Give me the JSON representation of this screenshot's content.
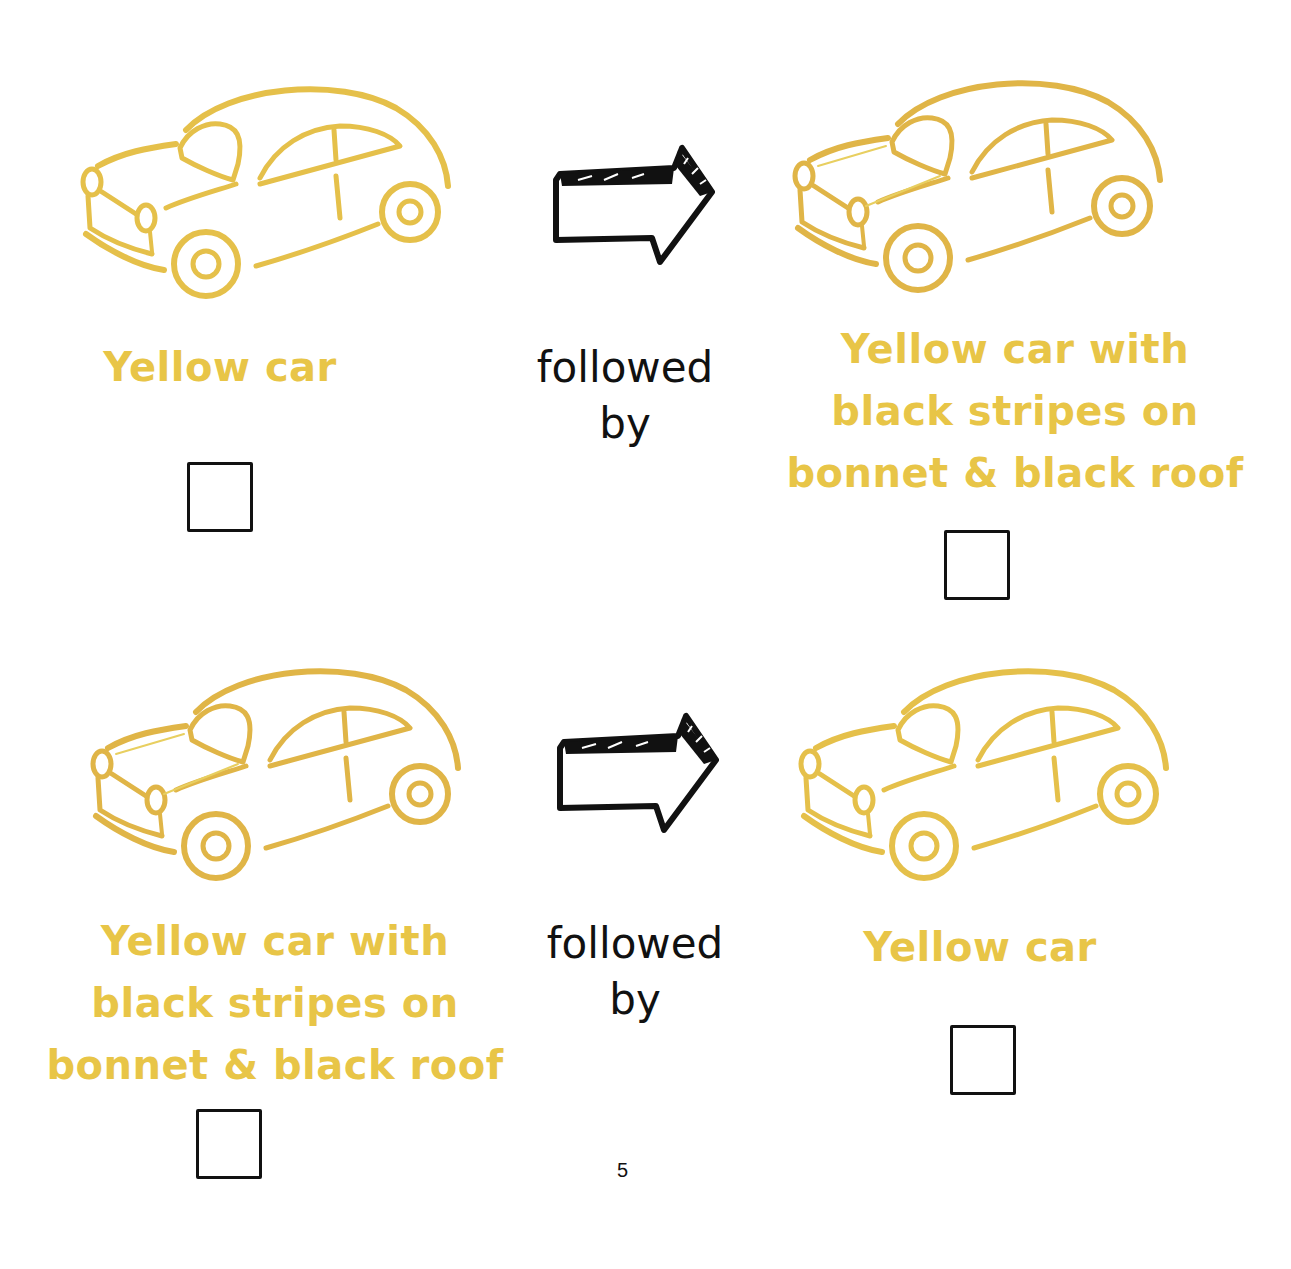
{
  "colors": {
    "car_yellow": "#E5C04A",
    "car_gold": "#E0B547",
    "label_yellow": "#E8C547",
    "ink": "#111111"
  },
  "rows": [
    {
      "left": {
        "label_lines": [
          "Yellow car"
        ],
        "variant": "plain"
      },
      "connector": {
        "lines": [
          "followed",
          "by"
        ]
      },
      "right": {
        "label_lines": [
          "Yellow car with",
          "black stripes on",
          "bonnet & black roof"
        ],
        "variant": "striped"
      }
    },
    {
      "left": {
        "label_lines": [
          "Yellow car with",
          "black stripes on",
          "bonnet & black roof"
        ],
        "variant": "striped"
      },
      "connector": {
        "lines": [
          "followed",
          "by"
        ]
      },
      "right": {
        "label_lines": [
          "Yellow car"
        ],
        "variant": "plain"
      }
    }
  ],
  "icons": {
    "arrow": "right-arrow-icon",
    "car": "car-icon",
    "checkbox": "empty-checkbox"
  },
  "page_number": "5"
}
